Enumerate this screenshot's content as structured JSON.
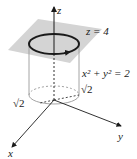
{
  "figure": {
    "labels": {
      "z_axis": "z",
      "x_axis": "x",
      "y_axis": "y",
      "plane": "z = 4",
      "cylinder": "x² + y² = 2",
      "radius_y": "√2",
      "radius_x": "√2"
    },
    "colors": {
      "plane_fill": "#cfcfcf",
      "line": "#1a1a1a",
      "cylinder_line": "#9a9a9a",
      "background": "#ffffff"
    }
  }
}
